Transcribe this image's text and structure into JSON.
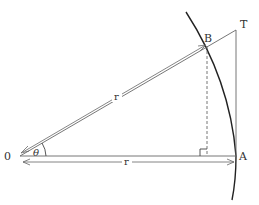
{
  "diagram": {
    "type": "geometry",
    "colors": {
      "stroke": "#555555",
      "arc": "#222222",
      "text": "#333333",
      "background": "#ffffff"
    },
    "points": {
      "O": {
        "label": "0",
        "x": 20,
        "y": 156
      },
      "A": {
        "label": "A",
        "x": 236,
        "y": 156
      },
      "B": {
        "label": "B",
        "x": 207,
        "y": 44
      },
      "T": {
        "label": "T",
        "x": 236,
        "y": 30
      }
    },
    "angle_label": "θ",
    "radius_label_OB": "r",
    "radius_label_OA": "r",
    "right_angle_at": "foot of perpendicular from B to OA"
  }
}
